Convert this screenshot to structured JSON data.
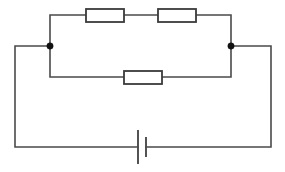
{
  "diagram": {
    "type": "electrical-circuit-schematic",
    "background_color": "#ffffff",
    "wire_color": "#4a4a4a",
    "component_outline_color": "#3a3a3a",
    "node_color": "#111111",
    "canvas": {
      "width": 285,
      "height": 172
    }
  },
  "components": {
    "resistors": [
      {
        "id": "resistor-top-left",
        "label": "",
        "branch": "top",
        "order": 1,
        "x": 86,
        "y": 9,
        "width": 38,
        "height": 13
      },
      {
        "id": "resistor-top-right",
        "label": "",
        "branch": "top",
        "order": 2,
        "x": 158,
        "y": 9,
        "width": 38,
        "height": 13
      },
      {
        "id": "resistor-middle",
        "label": "",
        "branch": "middle",
        "order": 1,
        "x": 124,
        "y": 71,
        "width": 38,
        "height": 13
      }
    ],
    "battery": {
      "id": "battery-cell",
      "label": "",
      "long_plate_x": 138,
      "long_plate_y1": 130,
      "long_plate_y2": 164,
      "short_plate_x": 146,
      "short_plate_y1": 137,
      "short_plate_y2": 157
    },
    "junction_nodes": [
      {
        "id": "node-left",
        "cx": 50,
        "cy": 46,
        "r": 3.2
      },
      {
        "id": "node-right",
        "cx": 231,
        "cy": 46,
        "r": 3.2
      }
    ]
  },
  "wires": {
    "outer_loop": "M 50 46 L 15 46 L 15 147 L 138 147 M 146 147 L 271 147 L 271 46 L 231 46",
    "top_branch_left_riser": "M 50 46 L 50 15 L 86 15",
    "top_branch_between": "M 124 15 L 158 15",
    "top_branch_right_riser": "M 196 15 L 231 15 L 231 46",
    "middle_branch_left": "M 50 46 L 50 77 L 124 77",
    "middle_branch_right": "M 162 77 L 231 77 L 231 46"
  }
}
